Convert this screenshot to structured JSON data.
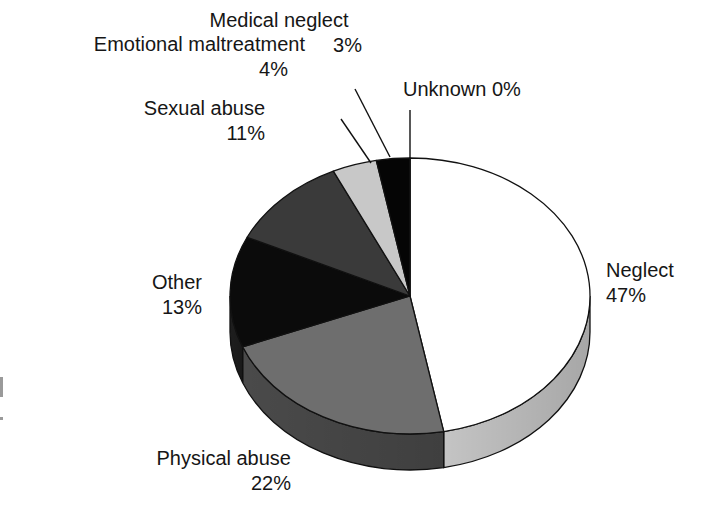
{
  "chart_data": {
    "type": "pie",
    "style": "3d-pie",
    "title": "",
    "start_angle_deg": 90,
    "direction": "clockwise",
    "categories": [
      "Neglect",
      "Physical abuse",
      "Other",
      "Sexual abuse",
      "Emotional maltreatment",
      "Medical neglect",
      "Unknown"
    ],
    "values": [
      47,
      22,
      13,
      11,
      4,
      3,
      0
    ],
    "unit": "%",
    "colors": [
      "#ffffff",
      "#6e6e6e",
      "#0b0b0b",
      "#3a3a3a",
      "#c8c8c8",
      "#050505",
      "#ffffff"
    ],
    "side_colors": [
      "#c4c4c4",
      "#4a4a4a",
      "#1e1e1e",
      "#2a2a2a",
      "#9a9a9a",
      "#050505",
      "#c4c4c4"
    ],
    "legend": "none (direct labels)"
  },
  "labels": {
    "neglect": {
      "name": "Neglect",
      "pct": "47%"
    },
    "physical": {
      "name": "Physical abuse",
      "pct": "22%"
    },
    "other": {
      "name": "Other",
      "pct": "13%"
    },
    "sexual": {
      "name": "Sexual abuse",
      "pct": "11%"
    },
    "emotional": {
      "name": "Emotional maltreatment",
      "pct": "4%"
    },
    "medical": {
      "name": "Medical neglect",
      "pct": "3%"
    },
    "unknown": {
      "name": "Unknown",
      "pct": "0%",
      "text": "Unknown 0%"
    }
  }
}
